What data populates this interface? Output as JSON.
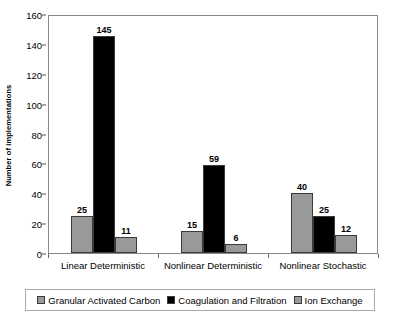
{
  "chart_data": {
    "type": "bar",
    "title": "",
    "subtitle": "",
    "xlabel": "",
    "ylabel": "Number of implementations",
    "ylim": [
      0,
      160
    ],
    "ytick_step": 20,
    "yticks": [
      "0",
      "20",
      "40",
      "60",
      "80",
      "100",
      "120",
      "140",
      "160"
    ],
    "grid": false,
    "legend_position": "bottom",
    "categories": [
      "Linear Deterministic",
      "Nonlinear Deterministic",
      "Nonlinear Stochastic"
    ],
    "series": [
      {
        "name": "Granular Activated Carbon",
        "color": "#999999",
        "values": [
          25,
          15,
          40
        ],
        "labels": [
          "25",
          "15",
          "40"
        ]
      },
      {
        "name": "Coagulation and Filtration",
        "color": "#000000",
        "values": [
          145,
          59,
          25
        ],
        "labels": [
          "145",
          "59",
          "25"
        ]
      },
      {
        "name": "Ion Exchange",
        "color": "#999999",
        "values": [
          11,
          6,
          12
        ],
        "labels": [
          "11",
          "6",
          "12"
        ]
      }
    ]
  }
}
